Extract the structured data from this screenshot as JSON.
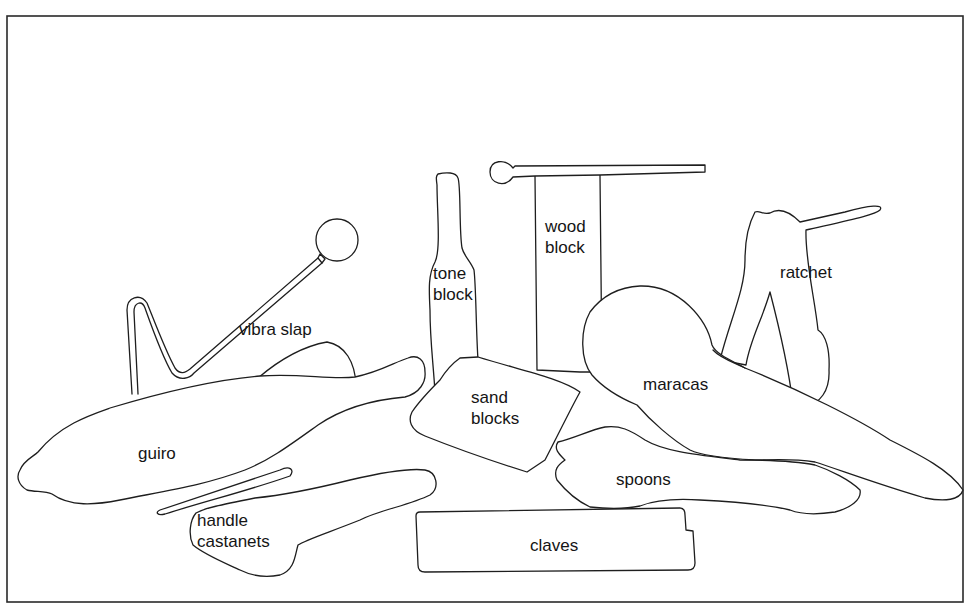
{
  "figure": {
    "labels": {
      "vibra_slap": "vibra slap",
      "tone_block": "tone\nblock",
      "wood_block": "wood\nblock",
      "ratchet": "ratchet",
      "maracas": "maracas",
      "sand_blocks": "sand\nblocks",
      "guiro": "guiro",
      "spoons": "spoons",
      "handle_castanets": "handle\ncastanets",
      "claves": "claves"
    },
    "colors": {
      "background": "#ffffff",
      "line": "#1e1e1e",
      "frame": "#2a2a2a"
    }
  }
}
